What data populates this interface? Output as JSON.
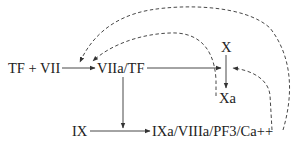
{
  "diagram": {
    "type": "coagulation-pathway",
    "nodes": {
      "tf_vii": "TF + VII",
      "viia_tf": "VIIa/TF",
      "x": "X",
      "xa": "Xa",
      "ix": "IX",
      "tenase": "IXa/VIIIa/PF3/Ca++"
    },
    "edges": [
      {
        "from": "TF + VII",
        "to": "VIIa/TF",
        "style": "solid"
      },
      {
        "from": "VIIa/TF",
        "to": "Xa",
        "style": "solid"
      },
      {
        "from": "X",
        "to": "Xa",
        "style": "solid"
      },
      {
        "from": "VIIa/TF",
        "to": "IX→IXa",
        "style": "solid"
      },
      {
        "from": "IX",
        "to": "IXa/VIIIa/PF3/Ca++",
        "style": "solid"
      },
      {
        "from": "Xa",
        "to": "TF + VII→VIIa/TF",
        "style": "dashed"
      },
      {
        "from": "IXa/VIIIa/PF3/Ca++",
        "to": "TF + VII→VIIa/TF",
        "style": "dashed"
      },
      {
        "from": "IXa/VIIIa/PF3/Ca++",
        "to": "X→Xa",
        "style": "dashed"
      }
    ],
    "colors": {
      "line": "#333333",
      "text": "#222222",
      "background": "#ffffff"
    }
  }
}
